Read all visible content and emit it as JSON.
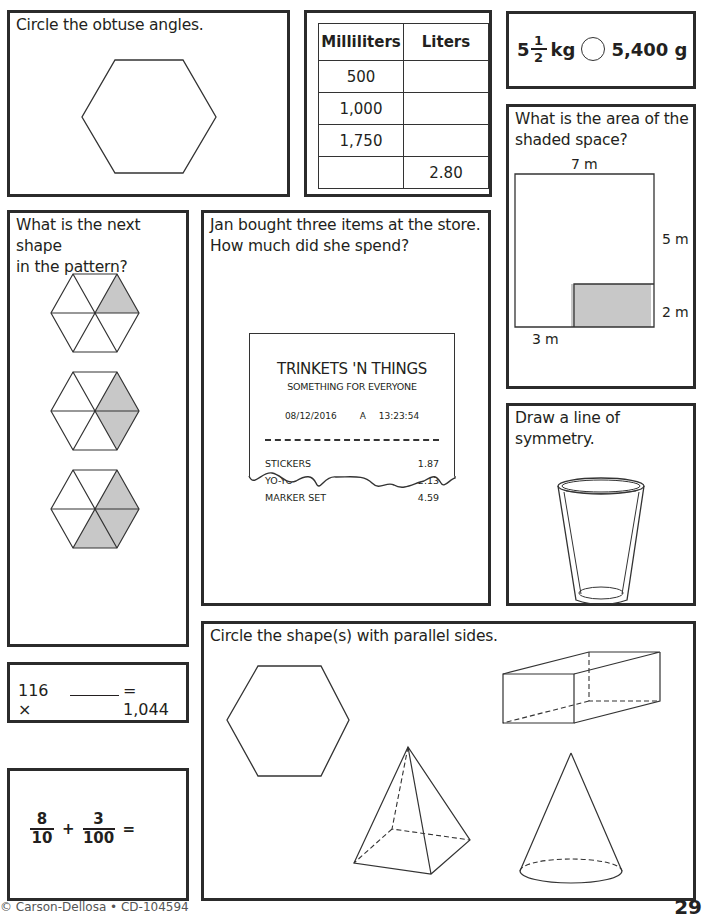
{
  "boxes": {
    "obtuse": {
      "prompt": "Circle the obtuse angles."
    },
    "conversion_table": {
      "headers": [
        "Milliliters",
        "Liters"
      ],
      "rows": [
        [
          "500",
          ""
        ],
        [
          "1,000",
          ""
        ],
        [
          "1,750",
          ""
        ],
        [
          "",
          "2.80"
        ]
      ]
    },
    "compare": {
      "whole": "5",
      "numerator": "1",
      "denominator": "2",
      "unit_left": "kg",
      "right_value": "5,400 g"
    },
    "area": {
      "prompt_line1": "What is the area of the",
      "prompt_line2": "shaded space?",
      "labels": {
        "top": "7 m",
        "right_upper": "5 m",
        "right_lower": "2 m",
        "bottom": "3 m"
      }
    },
    "pattern": {
      "prompt_line1": "What is the next shape",
      "prompt_line2": "in the pattern?"
    },
    "receipt": {
      "prompt_line1": "Jan bought three items at the store.",
      "prompt_line2": "How much did she spend?",
      "store_name": "TRINKETS 'N THINGS",
      "tagline": "SOMETHING FOR EVERYONE",
      "date": "08/12/2016",
      "register": "A",
      "time": "13:23:54",
      "items": [
        {
          "name": "STICKERS",
          "price": "1.87"
        },
        {
          "name": "YO-YO",
          "price": "2.13"
        },
        {
          "name": "MARKER SET",
          "price": "4.59"
        }
      ]
    },
    "symmetry": {
      "prompt_line1": "Draw a line of",
      "prompt_line2": "symmetry."
    },
    "multiply": {
      "left": "116 ×",
      "blank": "______",
      "right": "= 1,044"
    },
    "fractions": {
      "a_num": "8",
      "a_den": "10",
      "op": "+",
      "b_num": "3",
      "b_den": "100",
      "eq": "="
    },
    "parallel": {
      "prompt": "Circle the shape(s) with parallel sides."
    }
  },
  "footer": {
    "copyright": "© Carson-Dellosa • CD-104594",
    "page_number": "29"
  },
  "colors": {
    "border": "#2b2b2b",
    "shade": "#c8c8c8",
    "ink": "#231f20"
  }
}
